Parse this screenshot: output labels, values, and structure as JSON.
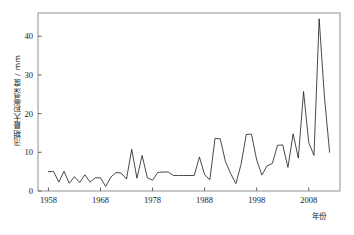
{
  "chart_data": {
    "type": "line",
    "title": "",
    "subtitle": "",
    "xlabel": "年份",
    "ylabel": "汛期最大积雪深度 / mm",
    "xlim": [
      1956,
      2014
    ],
    "ylim": [
      0,
      46
    ],
    "xticks": [
      1958,
      1968,
      1978,
      1988,
      1998,
      2008
    ],
    "yticks": [
      0,
      10,
      20,
      30,
      40
    ],
    "grid": false,
    "legend": null,
    "line_color": "#1a1a1a",
    "series": [
      {
        "name": "汛期最大积雪深度",
        "x": [
          1958,
          1959,
          1960,
          1961,
          1962,
          1963,
          1964,
          1965,
          1966,
          1967,
          1968,
          1969,
          1970,
          1971,
          1972,
          1973,
          1974,
          1975,
          1976,
          1977,
          1978,
          1979,
          1980,
          1981,
          1982,
          1983,
          1984,
          1985,
          1986,
          1987,
          1988,
          1989,
          1990,
          1991,
          1992,
          1993,
          1994,
          1995,
          1996,
          1997,
          1998,
          1999,
          2000,
          2001,
          2002,
          2003,
          2004,
          2005,
          2006,
          2007,
          2008,
          2009,
          2010,
          2011,
          2012
        ],
        "values": [
          5.0,
          5.0,
          2.3,
          5.1,
          2.0,
          3.7,
          2.2,
          4.2,
          2.3,
          3.4,
          3.4,
          1.2,
          3.6,
          4.8,
          4.6,
          3.1,
          10.8,
          3.3,
          9.2,
          3.4,
          2.8,
          4.8,
          4.9,
          4.9,
          4.0,
          4.0,
          4.0,
          4.0,
          4.0,
          8.8,
          4.2,
          2.9,
          13.6,
          13.5,
          7.6,
          4.5,
          1.9,
          6.9,
          14.6,
          14.7,
          8.0,
          4.1,
          6.5,
          7.1,
          11.8,
          11.9,
          6.1,
          14.8,
          8.5,
          25.7,
          12.5,
          9.2,
          44.5,
          24.5,
          10.0
        ]
      }
    ]
  },
  "axes": {
    "y_title": "汛期最大积雪深度 / mm",
    "x_title": "年份",
    "x_tick_labels": [
      "1958",
      "1968",
      "1978",
      "1988",
      "1998",
      "2008"
    ],
    "y_tick_labels": [
      "0",
      "10",
      "20",
      "30",
      "40"
    ]
  }
}
